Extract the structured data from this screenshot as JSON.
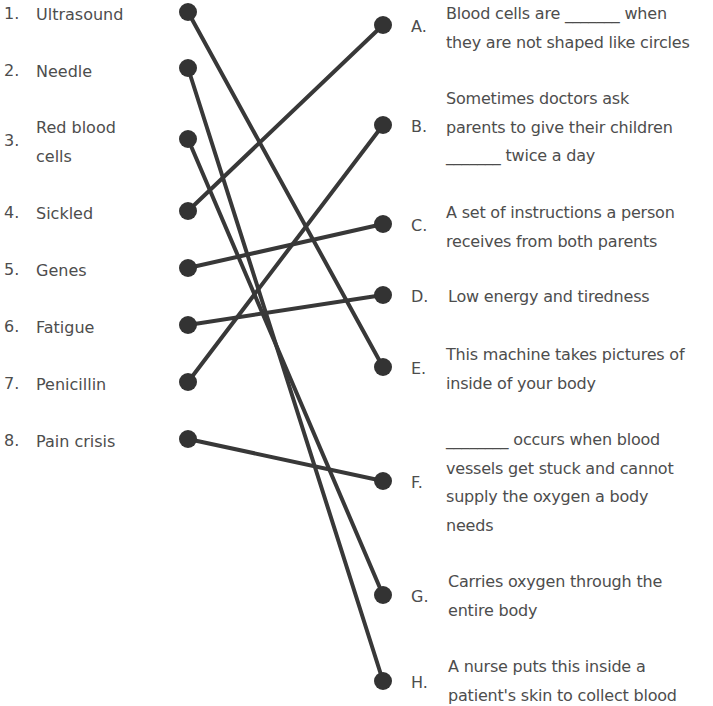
{
  "terms": [
    {
      "number": "1.",
      "label": "Ultrasound"
    },
    {
      "number": "2.",
      "label": "Needle"
    },
    {
      "number": "3.",
      "label_line1": "Red blood",
      "label_line2": "cells"
    },
    {
      "number": "4.",
      "label": "Sickled"
    },
    {
      "number": "5.",
      "label": "Genes"
    },
    {
      "number": "6.",
      "label": "Fatigue"
    },
    {
      "number": "7.",
      "label": "Penicillin"
    },
    {
      "number": "8.",
      "label": "Pain crisis"
    }
  ],
  "definitions": [
    {
      "letter": "A.",
      "lines": [
        "Blood cells are _______ when",
        "they are not shaped like circles"
      ]
    },
    {
      "letter": "B.",
      "lines": [
        "Sometimes doctors ask",
        "parents to give their children",
        "_______ twice a day"
      ]
    },
    {
      "letter": "C.",
      "lines": [
        "A set of instructions a person",
        "receives from both parents"
      ]
    },
    {
      "letter": "D.",
      "lines": [
        "Low energy and tiredness"
      ]
    },
    {
      "letter": "E.",
      "lines": [
        "This machine takes pictures of",
        "inside of your body"
      ]
    },
    {
      "letter": "F.",
      "lines": [
        "________ occurs when blood",
        "vessels get stuck and cannot",
        "supply the oxygen a body",
        "needs"
      ]
    },
    {
      "letter": "G.",
      "lines": [
        "Carries oxygen through the",
        "entire body"
      ]
    },
    {
      "letter": "H.",
      "lines": [
        "A nurse puts this inside a",
        "patient's skin to collect blood"
      ]
    }
  ],
  "matches": [
    {
      "term": "1",
      "definition": "E"
    },
    {
      "term": "2",
      "definition": "H"
    },
    {
      "term": "3",
      "definition": "G"
    },
    {
      "term": "4",
      "definition": "A"
    },
    {
      "term": "5",
      "definition": "C"
    },
    {
      "term": "6",
      "definition": "D"
    },
    {
      "term": "7",
      "definition": "B"
    },
    {
      "term": "8",
      "definition": "F"
    }
  ]
}
